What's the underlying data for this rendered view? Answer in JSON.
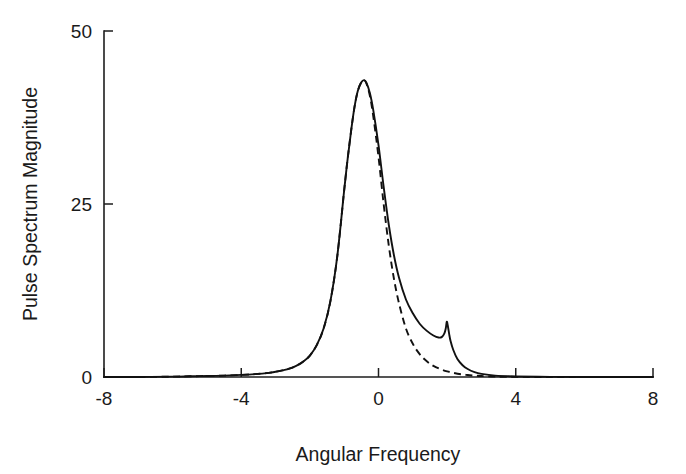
{
  "chart_data": {
    "type": "line",
    "title": "",
    "xlabel": "Angular Frequency",
    "ylabel": "Pulse Spectrum Magnitude",
    "xlim": [
      -8,
      8
    ],
    "ylim": [
      0,
      50
    ],
    "xticks": [
      -8,
      -4,
      0,
      4,
      8
    ],
    "yticks": [
      0,
      25,
      50
    ],
    "xtick_labels": [
      "-8",
      "-4",
      "0",
      "4",
      "8"
    ],
    "ytick_labels": [
      "0",
      "25",
      "50"
    ],
    "grid": false,
    "legend": "none",
    "background": "#ffffff",
    "line_color": "#111111",
    "series": [
      {
        "name": "solid-curve",
        "style": "solid",
        "annotation": "Main resonance peak near w = -0.4 with magnitude about 43, plus a sharp secondary resonance spike near w = 2.0 with magnitude about 8",
        "x": [
          -8.0,
          -7.0,
          -6.0,
          -5.5,
          -5.0,
          -4.5,
          -4.0,
          -3.6,
          -3.2,
          -3.0,
          -2.8,
          -2.6,
          -2.4,
          -2.2,
          -2.0,
          -1.8,
          -1.6,
          -1.4,
          -1.2,
          -1.0,
          -0.9,
          -0.8,
          -0.7,
          -0.6,
          -0.5,
          -0.42,
          -0.35,
          -0.25,
          -0.15,
          0.0,
          0.15,
          0.3,
          0.45,
          0.6,
          0.8,
          1.0,
          1.2,
          1.4,
          1.6,
          1.75,
          1.85,
          1.92,
          1.96,
          1.99,
          2.02,
          2.06,
          2.1,
          2.18,
          2.3,
          2.45,
          2.6,
          2.8,
          3.0,
          3.4,
          4.0,
          5.0,
          6.0,
          7.0,
          8.0
        ],
        "y": [
          0.0,
          0.0,
          0.05,
          0.1,
          0.15,
          0.2,
          0.3,
          0.42,
          0.6,
          0.75,
          0.95,
          1.2,
          1.6,
          2.2,
          3.1,
          4.6,
          7.0,
          11.0,
          17.5,
          27.0,
          31.5,
          35.5,
          39.0,
          41.4,
          42.6,
          42.9,
          42.5,
          41.0,
          38.5,
          33.5,
          27.5,
          22.0,
          17.6,
          14.3,
          11.2,
          9.2,
          7.7,
          6.7,
          6.0,
          5.7,
          5.8,
          6.3,
          7.0,
          8.0,
          7.4,
          6.2,
          5.2,
          3.9,
          2.6,
          1.7,
          1.15,
          0.7,
          0.45,
          0.2,
          0.08,
          0.02,
          0.0,
          0.0,
          0.0
        ]
      },
      {
        "name": "dashed-curve",
        "style": "dashed",
        "annotation": "Overlays the solid curve on the rising edge and at the main peak, then decays faster on the trailing edge and has no secondary spike",
        "x": [
          -8.0,
          -7.0,
          -6.0,
          -5.5,
          -5.0,
          -4.5,
          -4.0,
          -3.6,
          -3.2,
          -3.0,
          -2.8,
          -2.6,
          -2.4,
          -2.2,
          -2.0,
          -1.8,
          -1.6,
          -1.4,
          -1.2,
          -1.0,
          -0.9,
          -0.8,
          -0.7,
          -0.6,
          -0.5,
          -0.42,
          -0.35,
          -0.25,
          -0.15,
          0.0,
          0.15,
          0.3,
          0.45,
          0.6,
          0.8,
          1.0,
          1.2,
          1.4,
          1.6,
          1.8,
          2.0,
          2.2,
          2.4,
          2.6,
          2.8,
          3.0,
          3.4,
          4.0,
          5.0,
          6.0,
          7.0,
          8.0
        ],
        "y": [
          0.0,
          0.0,
          0.05,
          0.1,
          0.15,
          0.2,
          0.3,
          0.42,
          0.6,
          0.75,
          0.95,
          1.2,
          1.6,
          2.2,
          3.1,
          4.6,
          7.0,
          11.0,
          17.5,
          27.0,
          31.5,
          35.5,
          39.0,
          41.4,
          42.6,
          42.9,
          42.4,
          40.6,
          37.6,
          31.8,
          25.0,
          19.0,
          14.2,
          10.6,
          7.0,
          4.8,
          3.3,
          2.3,
          1.6,
          1.15,
          0.82,
          0.58,
          0.4,
          0.28,
          0.2,
          0.14,
          0.06,
          0.02,
          0.0,
          0.0,
          0.0,
          0.0
        ]
      }
    ]
  }
}
